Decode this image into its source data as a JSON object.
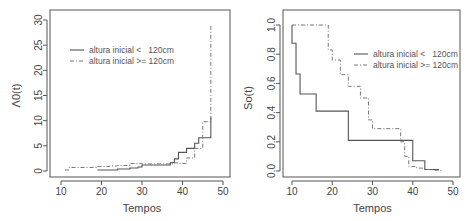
{
  "chart_data": [
    {
      "type": "line",
      "step": true,
      "title": "",
      "xlabel": "Tempos",
      "ylabel": "Λ0(t)",
      "xlim": [
        8,
        52
      ],
      "ylim": [
        -1,
        30.5
      ],
      "xticks": [
        10,
        20,
        30,
        40,
        50
      ],
      "yticks": [
        0,
        5,
        10,
        15,
        20,
        25,
        30
      ],
      "grid": false,
      "legend_position": "top-left",
      "series": [
        {
          "name": "altura inicial <   120cm",
          "style": "solid",
          "x": [
            19,
            24,
            27,
            29,
            30,
            37,
            38,
            39,
            41,
            43,
            44,
            47,
            47
          ],
          "y": [
            0.2,
            0.4,
            0.6,
            0.8,
            1.2,
            1.7,
            2.4,
            3.7,
            4.5,
            5.5,
            6.6,
            6.6,
            10.7
          ]
        },
        {
          "name": "altura inicial >= 120cm",
          "style": "dashed",
          "x": [
            11,
            12,
            19,
            20,
            22,
            24,
            27,
            29,
            30,
            37,
            38,
            39,
            41,
            43,
            45,
            47,
            47
          ],
          "y": [
            0.2,
            0.7,
            0.9,
            0.9,
            1.0,
            1.1,
            1.5,
            1.5,
            1.4,
            1.4,
            1.6,
            1.5,
            2.6,
            4.5,
            9.8,
            9.8,
            29
          ]
        }
      ]
    },
    {
      "type": "line",
      "step": true,
      "title": "",
      "xlabel": "Tempos",
      "ylabel": "So(t)",
      "xlim": [
        8,
        52
      ],
      "ylim": [
        -0.04,
        1.04
      ],
      "xticks": [
        10,
        20,
        30,
        40,
        50
      ],
      "yticks": [
        "0.0",
        "0.2",
        "0.4",
        "0.6",
        "0.8",
        "1.0"
      ],
      "grid": false,
      "legend_position": "top-right",
      "series": [
        {
          "name": "altura inicial <   120cm",
          "style": "solid",
          "x": [
            10,
            10,
            11,
            12,
            16,
            24,
            40,
            43,
            46.5
          ],
          "y": [
            1.0,
            0.875,
            0.664,
            0.527,
            0.41,
            0.21,
            0.07,
            0.01,
            0.01
          ]
        },
        {
          "name": "altura inicial >= 120cm",
          "style": "dashed",
          "x": [
            10,
            19,
            20,
            22,
            24,
            27,
            29,
            30,
            37,
            38,
            39,
            41,
            43,
            45,
            47
          ],
          "y": [
            1.0,
            0.83,
            0.76,
            0.66,
            0.58,
            0.5,
            0.35,
            0.29,
            0.2,
            0.1,
            0.03,
            0.02,
            0.01,
            0.005,
            0.0
          ]
        }
      ]
    }
  ]
}
